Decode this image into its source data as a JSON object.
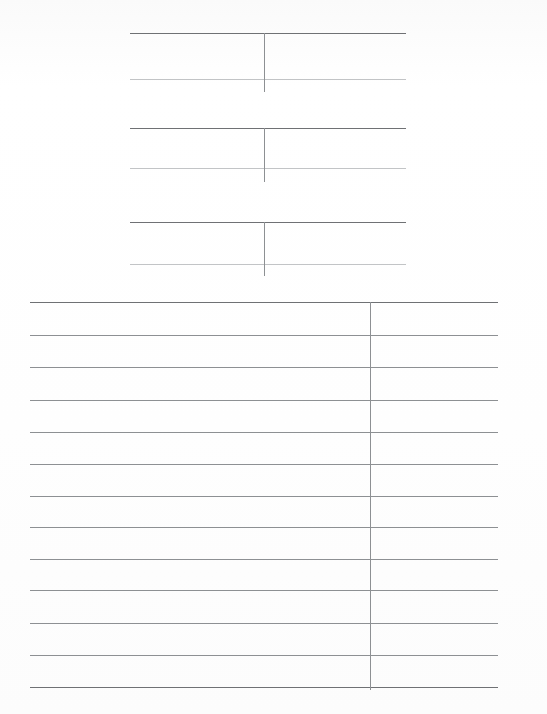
{
  "page": {
    "width": 547,
    "height": 714,
    "background_color": "#fefefe",
    "kind": "scanned-document-page",
    "visible_text": "",
    "note_label": "blank ruled tables"
  },
  "ghost": {
    "heading_text": "",
    "subline_text": ""
  },
  "colors": {
    "rule_strong": "#6f7174",
    "rule_mid": "#8d9093",
    "rule_light": "#a9acaf",
    "rule_faint": "#c2c4c6",
    "paper": "#fefefe"
  },
  "small_tables": [
    {
      "id": "small-table-1",
      "left": 130,
      "right": 406,
      "rules": [
        {
          "y": 33,
          "weight": "w-strong"
        },
        {
          "y": 79,
          "weight": "w-faint"
        }
      ],
      "divider": {
        "x": 264,
        "top": 33,
        "bottom": 92,
        "weight": "w-mid"
      },
      "header_cells": [
        "",
        ""
      ],
      "body_cells": [
        "",
        ""
      ]
    },
    {
      "id": "small-table-2",
      "left": 130,
      "right": 406,
      "rules": [
        {
          "y": 128,
          "weight": "w-strong"
        },
        {
          "y": 168,
          "weight": "w-faint"
        }
      ],
      "divider": {
        "x": 264,
        "top": 128,
        "bottom": 182,
        "weight": "w-mid"
      },
      "header_cells": [
        "",
        ""
      ],
      "body_cells": [
        "",
        ""
      ]
    },
    {
      "id": "small-table-3",
      "left": 130,
      "right": 406,
      "rules": [
        {
          "y": 222,
          "weight": "w-strong"
        },
        {
          "y": 264,
          "weight": "w-faint"
        }
      ],
      "divider": {
        "x": 264,
        "top": 222,
        "bottom": 276,
        "weight": "w-mid"
      },
      "header_cells": [
        "",
        ""
      ],
      "body_cells": [
        "",
        ""
      ]
    }
  ],
  "main_table": {
    "id": "main-table",
    "left": 30,
    "right": 498,
    "divider": {
      "x": 370,
      "top": 302,
      "bottom": 690,
      "weight": "w-mid"
    },
    "rules": [
      {
        "y": 302,
        "weight": "w-strong"
      },
      {
        "y": 335,
        "weight": "w-mid"
      },
      {
        "y": 367,
        "weight": "w-mid"
      },
      {
        "y": 400,
        "weight": "w-mid"
      },
      {
        "y": 432,
        "weight": "w-mid"
      },
      {
        "y": 464,
        "weight": "w-mid"
      },
      {
        "y": 496,
        "weight": "w-mid"
      },
      {
        "y": 527,
        "weight": "w-mid"
      },
      {
        "y": 559,
        "weight": "w-mid"
      },
      {
        "y": 590,
        "weight": "w-mid"
      },
      {
        "y": 623,
        "weight": "w-mid"
      },
      {
        "y": 655,
        "weight": "w-mid"
      },
      {
        "y": 687,
        "weight": "w-strong"
      }
    ],
    "row_count": 12,
    "column_headers": [
      "",
      ""
    ],
    "rows": [
      [
        "",
        ""
      ],
      [
        "",
        ""
      ],
      [
        "",
        ""
      ],
      [
        "",
        ""
      ],
      [
        "",
        ""
      ],
      [
        "",
        ""
      ],
      [
        "",
        ""
      ],
      [
        "",
        ""
      ],
      [
        "",
        ""
      ],
      [
        "",
        ""
      ],
      [
        "",
        ""
      ],
      [
        "",
        ""
      ]
    ]
  }
}
